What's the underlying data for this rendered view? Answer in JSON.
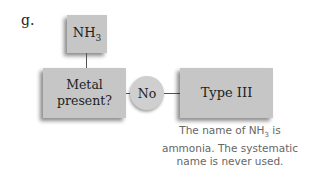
{
  "diagram": {
    "item_label": "g.",
    "start_node": {
      "formula_main": "NH",
      "formula_sub": "3"
    },
    "decision_node": {
      "line1": "Metal",
      "line2": "present?"
    },
    "branch_label": "No",
    "result_node": {
      "label": "Type III"
    },
    "note": {
      "part1": "The name of NH",
      "sub": "3",
      "part2": " is",
      "line2": "ammonia. The systematic",
      "line3": "name is never used."
    },
    "colors": {
      "box_fill": "#c6c6c6",
      "circle_fill": "#cfcfcf",
      "note_text": "#666666",
      "connector": "#555555"
    }
  }
}
